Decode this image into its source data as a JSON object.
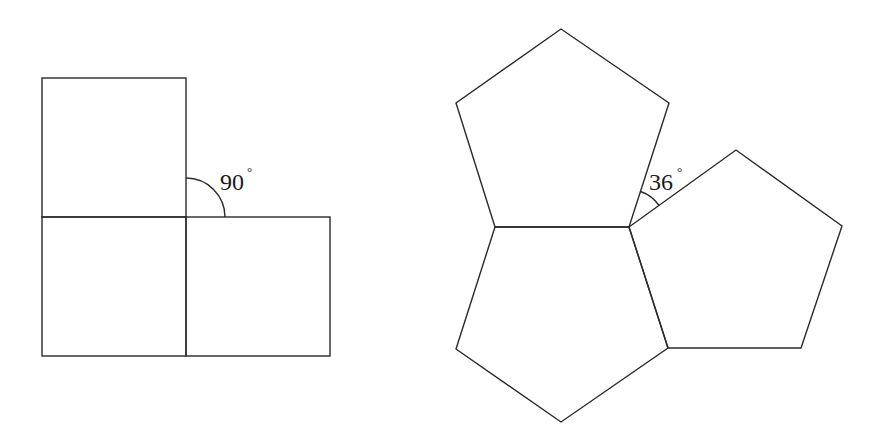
{
  "figures": {
    "left": {
      "description": "Three squares meeting at a vertex",
      "angle_value": "90",
      "angle_unit": "°"
    },
    "right": {
      "description": "Three regular pentagons meeting at a vertex",
      "angle_value": "36",
      "angle_unit": "°"
    }
  },
  "colors": {
    "stroke": "#2a2a2a",
    "background": "#ffffff"
  }
}
